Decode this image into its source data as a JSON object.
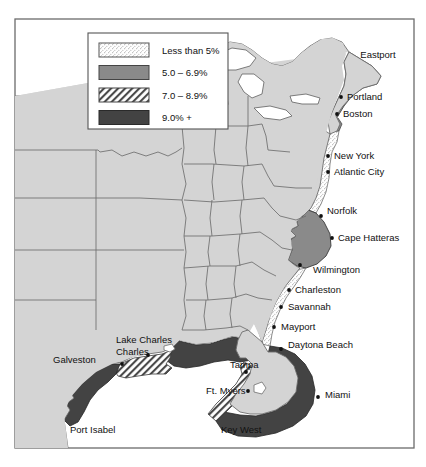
{
  "figure": {
    "name": "east-coast-gulf-coast-percentage-map",
    "frame_color": "#6b6b6b",
    "background": "#ffffff"
  },
  "legend": {
    "name": "legend-box",
    "border_color": "#555555",
    "background": "#ffffff",
    "items": [
      {
        "label": "Less than 5%",
        "pattern": "stipple",
        "fill": "#ffffff",
        "swatch_border": "#555555"
      },
      {
        "label": "5.0 – 6.9%",
        "pattern": "solid",
        "fill": "#8a8a8a",
        "swatch_border": "#444444"
      },
      {
        "label": "7.0 – 8.9%",
        "pattern": "hatch",
        "fill": "#ffffff",
        "swatch_border": "#444444"
      },
      {
        "label": "9.0% +",
        "pattern": "solid",
        "fill": "#434343",
        "swatch_border": "#2a2a2a"
      }
    ]
  },
  "map": {
    "land_fill": "#d4d4d4",
    "land_stroke": "#6e6e6e",
    "water_fill": "#ffffff",
    "band_colors": {
      "less_than_5": "#ffffff",
      "five_to_six_nine": "#8a8a8a",
      "seven_to_eight_nine": "#ffffff",
      "nine_plus": "#434343"
    }
  },
  "cities": [
    {
      "name": "Eastport",
      "label": "Eastport",
      "lx": 378,
      "ly": 58,
      "dx": 362,
      "dy": 68,
      "anchor": "middle",
      "dot": false
    },
    {
      "name": "Portland",
      "label": "Portland",
      "lx": 347,
      "ly": 100,
      "dx": 341,
      "dy": 97,
      "anchor": "start",
      "dot": true
    },
    {
      "name": "Boston",
      "label": "Boston",
      "lx": 343,
      "ly": 117,
      "dx": 337,
      "dy": 114,
      "anchor": "start",
      "dot": true
    },
    {
      "name": "New York",
      "label": "New York",
      "lx": 334,
      "ly": 159,
      "dx": 328,
      "dy": 156,
      "anchor": "start",
      "dot": true
    },
    {
      "name": "Atlantic City",
      "label": "Atlantic City",
      "lx": 334,
      "ly": 175,
      "dx": 328,
      "dy": 172,
      "anchor": "start",
      "dot": true
    },
    {
      "name": "Norfolk",
      "label": "Norfolk",
      "lx": 327,
      "ly": 214,
      "dx": 321,
      "dy": 216,
      "anchor": "start",
      "dot": true
    },
    {
      "name": "Cape Hatteras",
      "label": "Cape Hatteras",
      "lx": 338,
      "ly": 241,
      "dx": 332,
      "dy": 238,
      "anchor": "start",
      "dot": true
    },
    {
      "name": "Wilmington",
      "label": "Wilmington",
      "lx": 313,
      "ly": 273,
      "dx": 300,
      "dy": 265,
      "anchor": "start",
      "dot": true
    },
    {
      "name": "Charleston",
      "label": "Charleston",
      "lx": 295,
      "ly": 293,
      "dx": 289,
      "dy": 290,
      "anchor": "start",
      "dot": true
    },
    {
      "name": "Savannah",
      "label": "Savannah",
      "lx": 288,
      "ly": 310,
      "dx": 281,
      "dy": 307,
      "anchor": "start",
      "dot": true
    },
    {
      "name": "Mayport",
      "label": "Mayport",
      "lx": 281,
      "ly": 330,
      "dx": 274,
      "dy": 327,
      "anchor": "start",
      "dot": true
    },
    {
      "name": "Daytona Beach",
      "label": "Daytona Beach",
      "lx": 288,
      "ly": 348,
      "dx": 281,
      "dy": 349,
      "anchor": "start",
      "dot": true
    },
    {
      "name": "Miami",
      "label": "Miami",
      "lx": 325,
      "ly": 398,
      "dx": 318,
      "dy": 397,
      "anchor": "start",
      "dot": true
    },
    {
      "name": "Key West",
      "label": "Key West",
      "lx": 221,
      "ly": 433,
      "dx": 268,
      "dy": 427,
      "anchor": "start",
      "dot": false
    },
    {
      "name": "Ft. Myers",
      "label": "Ft. Myers",
      "lx": 206,
      "ly": 394,
      "dx": 248,
      "dy": 391,
      "anchor": "start",
      "dot": true
    },
    {
      "name": "Tampa",
      "label": "Tampa",
      "lx": 230,
      "ly": 368,
      "dx": 246,
      "dy": 372,
      "anchor": "start",
      "dot": true
    },
    {
      "name": "Lake Charles",
      "label": "Lake Charles",
      "lx": 116,
      "ly": 343,
      "dx": 148,
      "dy": 355,
      "anchor": "start",
      "dot": true
    },
    {
      "name": "Galveston",
      "label": "Galveston",
      "lx": 53,
      "ly": 363,
      "dx": 122,
      "dy": 364,
      "anchor": "start",
      "dot": true
    },
    {
      "name": "Port Isabel",
      "label": "Port Isabel",
      "lx": 70,
      "ly": 433,
      "dx": 74,
      "dy": 424,
      "anchor": "start",
      "dot": false
    }
  ],
  "city_label_lines": [
    {
      "name": "lake-charles-second-line",
      "label": "Charles",
      "lx": 116,
      "ly": 355
    }
  ]
}
